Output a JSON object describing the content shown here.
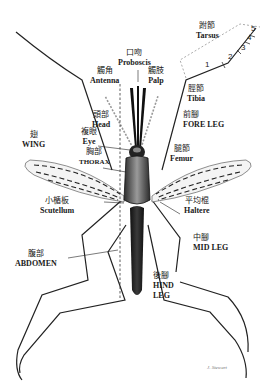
{
  "diagram": {
    "labels": {
      "tarsus": {
        "zh": "跗節",
        "en": "Tarsus"
      },
      "proboscis": {
        "zh": "口吻",
        "en": "Proboscis"
      },
      "antenna": {
        "zh": "觸角",
        "en": "Antenna"
      },
      "palp": {
        "zh": "觸肢",
        "en": "Palp"
      },
      "tibia": {
        "zh": "脛節",
        "en": "Tibia"
      },
      "head": {
        "zh": "頭部",
        "en": "Head"
      },
      "fore_leg": {
        "zh": "前腳",
        "en": "FORE LEG"
      },
      "wing": {
        "zh": "翅",
        "en": "WING"
      },
      "eye": {
        "zh": "複眼",
        "en": "Eye"
      },
      "thorax": {
        "zh": "胸部",
        "en": "THORAX"
      },
      "femur": {
        "zh": "腿節",
        "en": "Femur"
      },
      "scutellum": {
        "zh": "小楯板",
        "en": "Scutellum"
      },
      "haltere": {
        "zh": "平均棍",
        "en": "Haltere"
      },
      "mid_leg": {
        "zh": "中腳",
        "en": "MID LEG"
      },
      "abdomen": {
        "zh": "腹部",
        "en": "ABDOMEN"
      },
      "hind_leg": {
        "zh": "後腳",
        "en": "HIND",
        "en2": "LEG"
      }
    },
    "tarsal_segments": [
      "1",
      "2",
      "3",
      "4",
      "5"
    ],
    "signature": "J. Stewart"
  }
}
